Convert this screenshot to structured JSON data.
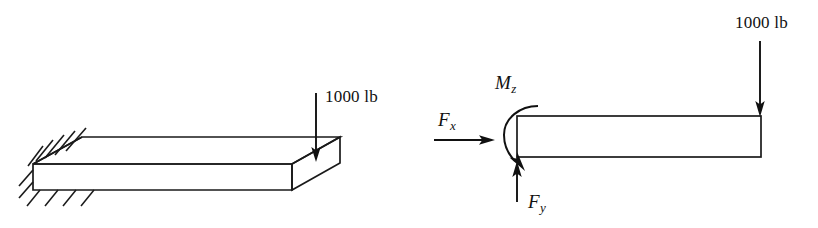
{
  "figure": {
    "background_color": "#ffffff",
    "line_color": "#1a1a1a",
    "width": 818,
    "height": 228
  },
  "left_diagram": {
    "name": "cantilever-slab-3d",
    "description": "Isometric rectangular slab fixed at left end with hatched wall support and a downward point load near the right end",
    "load_label": "1000 lb",
    "support_type": "fixed",
    "hatch_count_top": 5,
    "hatch_count_bottom": 4
  },
  "right_diagram": {
    "name": "free-body-diagram",
    "description": "Side view beam showing reaction force components and applied load",
    "load_label": "1000 lb",
    "reactions": [
      {
        "symbol": "F",
        "subscript": "x",
        "label": "Fx",
        "direction": "right",
        "kind": "horizontal-force"
      },
      {
        "symbol": "F",
        "subscript": "y",
        "label": "Fy",
        "direction": "up",
        "kind": "vertical-force"
      },
      {
        "symbol": "M",
        "subscript": "z",
        "label": "Mz",
        "direction": "clockwise",
        "kind": "moment"
      }
    ]
  }
}
